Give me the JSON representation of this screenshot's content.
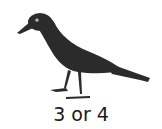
{
  "image": {
    "subject": "crow",
    "icon": "crow-illustration",
    "colors": {
      "bird": "#2b2b2b",
      "eye": "#ffffff",
      "background": "#ffffff"
    }
  },
  "caption": "3 or 4"
}
